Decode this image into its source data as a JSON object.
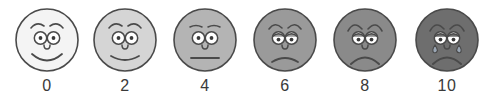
{
  "scale": {
    "name": "faces-pain-rating-scale",
    "stroke_color": "#4a4a4a",
    "eye_white_color": "#ffffff",
    "pupil_color": "#3a3a3a",
    "tear_color": "#9aa6b4",
    "label_color": "#3a3a3a",
    "background_color": "#ffffff",
    "faces": [
      {
        "label": "0",
        "expression": "smiling",
        "face_color": "#f4f4f4",
        "center_x": 47,
        "diameter": 62,
        "mouth": "big-smile",
        "brows": "arched-up",
        "has_tears": false
      },
      {
        "label": "2",
        "expression": "slight-smile",
        "face_color": "#d5d5d5",
        "center_x": 125,
        "diameter": 62,
        "mouth": "smile",
        "brows": "arched-up",
        "has_tears": false
      },
      {
        "label": "4",
        "expression": "neutral",
        "face_color": "#b4b4b4",
        "center_x": 205,
        "diameter": 62,
        "mouth": "flat-line",
        "brows": "flat",
        "has_tears": false
      },
      {
        "label": "6",
        "expression": "slight-frown",
        "face_color": "#9a9a9a",
        "center_x": 285,
        "diameter": 62,
        "mouth": "frown",
        "brows": "worried",
        "has_tears": false
      },
      {
        "label": "8",
        "expression": "frowning",
        "face_color": "#8a8a8a",
        "center_x": 365,
        "diameter": 62,
        "mouth": "deep-frown",
        "brows": "very-worried",
        "has_tears": false
      },
      {
        "label": "10",
        "expression": "crying",
        "face_color": "#6e6e6e",
        "center_x": 447,
        "diameter": 62,
        "mouth": "deep-frown",
        "brows": "very-worried",
        "has_tears": true
      }
    ]
  }
}
